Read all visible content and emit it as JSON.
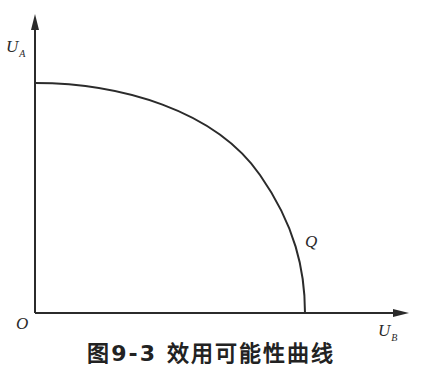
{
  "figure": {
    "y_axis_label": {
      "main": "U",
      "sub": "A"
    },
    "x_axis_label": {
      "main": "U",
      "sub": "B"
    },
    "origin_label": "O",
    "curve_label": "Q",
    "caption": "图9-3  效用可能性曲线"
  },
  "colors": {
    "line": "#2b2b2b",
    "background": "#ffffff"
  }
}
